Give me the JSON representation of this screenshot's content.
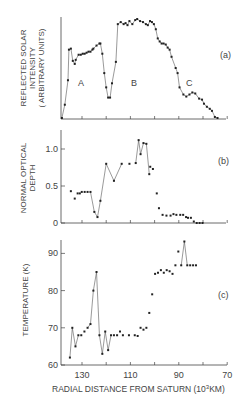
{
  "figure": {
    "xlabel": "RADIAL DISTANCE FROM SATURN (10",
    "xlabel_sup": "3",
    "xlabel_end": "KM)"
  },
  "chart_data": [
    {
      "id": "a",
      "type": "line",
      "panel_label": "(a)",
      "ylabel_lines": [
        "REFLECTED SOLAR",
        "INTENSITY",
        "( ARBITRARY UNITS)"
      ],
      "xlabel": "",
      "xlim": [
        141,
        70
      ],
      "ylim": [
        0,
        100
      ],
      "xticks": [
        130,
        120,
        110,
        100,
        90,
        80,
        70
      ],
      "xtick_labels": [],
      "yticks": [],
      "annotations": [
        {
          "text": "A",
          "x": 124,
          "y": 40
        },
        {
          "text": "B",
          "x": 106,
          "y": 40
        },
        {
          "text": "C",
          "x": 86,
          "y": 30
        }
      ],
      "connected": true,
      "x": [
        138.3,
        137.1,
        135.8,
        135.4,
        134.6,
        133.8,
        133.0,
        132.6,
        131.4,
        130.5,
        129.7,
        128.9,
        128.1,
        127.3,
        126.5,
        125.7,
        125.3,
        124.0,
        122.8,
        122.4,
        121.6,
        120.8,
        120.0,
        119.2,
        118.4,
        117.6,
        116.0,
        115.2,
        114.0,
        112.8,
        112.0,
        111.2,
        110.4,
        109.2,
        108.0,
        107.2,
        106.0,
        104.8,
        103.6,
        102.8,
        101.9,
        101.1,
        100.3,
        99.5,
        98.7,
        97.9,
        97.1,
        96.3,
        95.4,
        94.6,
        93.8,
        93.0,
        91.3,
        90.5,
        89.7,
        88.1,
        86.9,
        85.6,
        84.4,
        83.2,
        81.6,
        80.4,
        79.6,
        78.4,
        77.2,
        76.3,
        75.1
      ],
      "y": [
        1,
        14,
        38,
        68,
        69,
        57,
        54,
        58,
        63,
        63,
        64,
        64,
        65,
        66,
        66,
        68,
        69,
        72,
        74,
        74,
        64,
        45,
        31,
        21,
        21,
        35,
        56,
        93,
        95,
        93,
        94,
        92,
        96,
        93,
        97,
        98,
        96,
        95,
        93,
        92,
        96,
        95,
        93,
        88,
        79,
        76,
        74,
        74,
        73,
        70,
        68,
        61,
        50,
        45,
        31,
        24,
        22,
        24,
        26,
        25,
        20,
        19,
        15,
        12,
        10,
        8,
        2
      ],
      "x_tail": [
        74.0
      ],
      "y_tail": [
        1
      ]
    },
    {
      "id": "b",
      "type": "line",
      "panel_label": "(b)",
      "ylabel_lines": [
        "NORMAL OPTICAL",
        "DEPTH"
      ],
      "xlim": [
        141,
        70
      ],
      "ylim": [
        0,
        1.2
      ],
      "yticks": [
        0,
        0.5,
        1.0
      ],
      "ytick_labels": [
        "0",
        "0.5",
        "1.0"
      ],
      "xticks": [
        130,
        120,
        110,
        100,
        90,
        80,
        70
      ],
      "connected_segments": "partial",
      "x": [
        134.6,
        133.0,
        131.8,
        130.9,
        130.1,
        128.9,
        127.7,
        126.5,
        124.9,
        123.6,
        122.4,
        120.0,
        116.8,
        113.6,
        110.4,
        107.8,
        106.6,
        105.8,
        104.6,
        103.4,
        102.2,
        101.8,
        100.7,
        99.1,
        98.2,
        96.7,
        95.1,
        93.4,
        92.2,
        91.0,
        89.4,
        88.2,
        87.0,
        86.2,
        85.0,
        83.8,
        82.6,
        81.4,
        80.2
      ],
      "y": [
        0.43,
        0.33,
        0.4,
        0.4,
        0.42,
        0.42,
        0.42,
        0.42,
        0.15,
        0.08,
        0.3,
        0.8,
        0.57,
        0.8,
        0.8,
        0.81,
        1.12,
        0.93,
        1.08,
        1.07,
        0.66,
        0.76,
        0.73,
        0.4,
        0.2,
        0.11,
        0.1,
        0.1,
        0.12,
        0.11,
        0.11,
        0.11,
        0.08,
        0.07,
        0.07,
        0.02,
        0.0,
        0.0,
        0.0
      ]
    },
    {
      "id": "c",
      "type": "line",
      "panel_label": "(c)",
      "ylabel_lines": [
        "TEMPERATURE (K)"
      ],
      "xlabel": "RADIAL DISTANCE FROM SATURN (10^3 KM)",
      "xlim": [
        141,
        70
      ],
      "ylim": [
        60,
        93
      ],
      "yticks": [
        60,
        70,
        80,
        90
      ],
      "ytick_labels": [
        "60",
        "70",
        "80",
        "90"
      ],
      "xticks": [
        130,
        120,
        110,
        100,
        90,
        80,
        70
      ],
      "xtick_labels": [
        "130",
        "",
        "110",
        "",
        "90",
        "",
        "70"
      ],
      "x": [
        135.0,
        134.0,
        132.7,
        131.5,
        130.3,
        129.0,
        127.7,
        126.5,
        125.3,
        124.0,
        122.8,
        121.6,
        120.4,
        119.2,
        118.0,
        116.8,
        115.5,
        114.3,
        113.1,
        110.6,
        108.2,
        107.0,
        105.8,
        104.6,
        103.4,
        102.2,
        101.0,
        99.8,
        98.6,
        97.4,
        96.2,
        95.0,
        93.8,
        92.6,
        91.4,
        90.2,
        89.0,
        87.7,
        86.5,
        85.3,
        84.1,
        82.9,
        81.7,
        80.4,
        79.2,
        78.0,
        76.8,
        75.6,
        74.4
      ],
      "y": [
        62,
        70,
        65,
        68,
        68,
        69,
        70,
        71,
        80,
        85,
        68,
        63,
        69,
        64,
        68,
        68,
        68,
        69,
        68,
        68,
        68,
        67.8,
        70,
        69.5,
        70,
        74,
        79,
        84.5,
        84.8,
        85.5,
        84.8,
        85.5,
        85.2,
        84.5,
        86.8,
        90.5,
        86.8,
        93.2,
        86.8,
        86.8,
        86.8,
        86.8,
        86.8,
        86.8,
        86.8,
        86.8,
        86.8,
        86.8,
        86.8
      ]
    }
  ]
}
